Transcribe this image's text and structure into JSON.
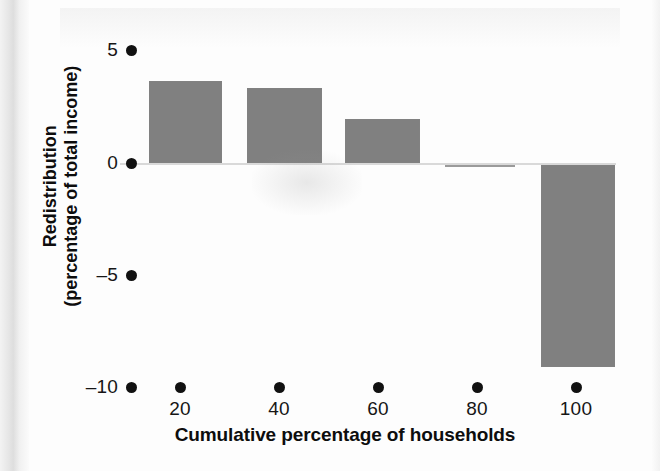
{
  "figure": {
    "y_axis_title_line1": "Redistribution",
    "y_axis_title_line2": "(percentage of total income)",
    "x_axis_title": "Cumulative percentage of households"
  },
  "chart_data": {
    "type": "bar",
    "title": "",
    "xlabel": "Cumulative percentage of households",
    "ylabel": "Redistribution (percentage of total income)",
    "categories": [
      "20",
      "40",
      "60",
      "80",
      "100"
    ],
    "values": [
      3.65,
      3.35,
      1.95,
      -0.1,
      -9.0
    ],
    "series": [
      {
        "name": "Redistribution",
        "values": [
          3.65,
          3.35,
          1.95,
          -0.1,
          -9.0
        ]
      }
    ],
    "ylim": [
      -10,
      6
    ],
    "xlim": [
      0,
      110
    ],
    "yticks": [
      5,
      0,
      -5,
      -10
    ],
    "ytick_labels": [
      "5",
      "0",
      "–10"
    ],
    "ytick_label_5": "5",
    "ytick_label_0": "0",
    "ytick_label_neg5": "–5",
    "ytick_label_neg10": "–10",
    "xticks": [
      20,
      40,
      60,
      80,
      100
    ],
    "xtick_labels": [
      "20",
      "40",
      "60",
      "80",
      "100"
    ],
    "grid": false,
    "legend": "none",
    "bar_color": "#808080",
    "axis_color": "#111111",
    "zero_line_color": "#d9d9d9",
    "tick_marker_style": "filled-circle"
  }
}
